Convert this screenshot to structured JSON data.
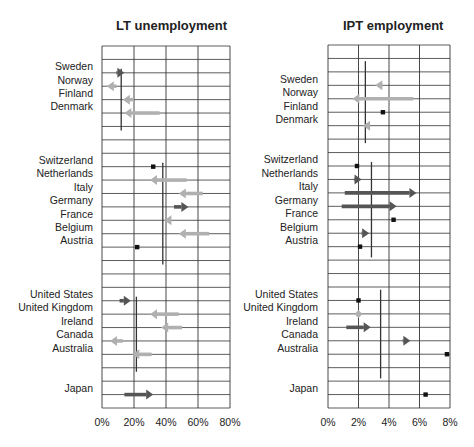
{
  "chart_data": [
    {
      "type": "arrow-dot",
      "title": "LT unemployment",
      "xlabel": "",
      "ylabel": "",
      "xlim": [
        0,
        80
      ],
      "x_ticks": [
        "0%",
        "20%",
        "40%",
        "60%",
        "80%"
      ],
      "grid": true,
      "rows_total": 27,
      "groups": [
        {
          "avg": 12,
          "rows": [
            2,
            6
          ]
        },
        {
          "avg": 38,
          "rows": [
            9,
            16
          ]
        },
        {
          "avg": 21.5,
          "rows": [
            19,
            24
          ]
        }
      ],
      "countries": [
        {
          "name": "Sweden",
          "row": 2,
          "from": 9,
          "to": 14,
          "style": "dark"
        },
        {
          "name": "Norway",
          "row": 3,
          "from": 9,
          "to": 3,
          "style": "light"
        },
        {
          "name": "Finland",
          "row": 4,
          "from": 20,
          "to": 13,
          "style": "light"
        },
        {
          "name": "Denmark",
          "row": 5,
          "from": 36,
          "to": 14,
          "style": "light"
        },
        {
          "name": "Switzerland",
          "row": 9,
          "from": 32,
          "to": 32,
          "style": "dot"
        },
        {
          "name": "Netherlands",
          "row": 10,
          "from": 53,
          "to": 30,
          "style": "light"
        },
        {
          "name": "Italy",
          "row": 11,
          "from": 63,
          "to": 48,
          "style": "light"
        },
        {
          "name": "Germany",
          "row": 12,
          "from": 45,
          "to": 54,
          "style": "dark"
        },
        {
          "name": "France",
          "row": 13,
          "from": 43,
          "to": 39,
          "style": "light"
        },
        {
          "name": "Belgium",
          "row": 14,
          "from": 67,
          "to": 48,
          "style": "light"
        },
        {
          "name": "Austria",
          "row": 15,
          "from": 22,
          "to": 22,
          "style": "dot"
        },
        {
          "name": "United States",
          "row": 19,
          "from": 11,
          "to": 18,
          "style": "dark"
        },
        {
          "name": "United Kingdom",
          "row": 20,
          "from": 48,
          "to": 30,
          "style": "light"
        },
        {
          "name": "Ireland",
          "row": 21,
          "from": 50,
          "to": 37,
          "style": "light"
        },
        {
          "name": "Canada",
          "row": 22,
          "from": 13,
          "to": 5,
          "style": "light"
        },
        {
          "name": "Australia",
          "row": 23,
          "from": 31,
          "to": 19,
          "style": "light"
        },
        {
          "name": "Japan",
          "row": 26,
          "from": 14,
          "to": 32,
          "style": "dark"
        }
      ]
    },
    {
      "type": "arrow-dot",
      "title": "IPT employment",
      "xlabel": "",
      "ylabel": "",
      "xlim": [
        0,
        8
      ],
      "x_ticks": [
        "0%",
        "2%",
        "4%",
        "6%",
        "8%"
      ],
      "grid": true,
      "rows_total": 27,
      "groups": [
        {
          "avg": 2.45,
          "rows": [
            1.5,
            7
          ]
        },
        {
          "avg": 2.85,
          "rows": [
            9,
            15.5
          ]
        },
        {
          "avg": 3.45,
          "rows": [
            18.5,
            24.5
          ]
        }
      ],
      "countries": [
        {
          "name": "Sweden",
          "row": 3,
          "from": 3.6,
          "to": 3.1,
          "style": "light"
        },
        {
          "name": "Norway",
          "row": 4,
          "from": 5.6,
          "to": 1.6,
          "style": "light"
        },
        {
          "name": "Finland",
          "row": 5,
          "from": 3.6,
          "to": 3.6,
          "style": "dot"
        },
        {
          "name": "Denmark",
          "row": 6,
          "from": 2.6,
          "to": 2.3,
          "style": "light"
        },
        {
          "name": "Switzerland",
          "row": 9,
          "from": 1.9,
          "to": 1.9,
          "style": "dot"
        },
        {
          "name": "Netherlands",
          "row": 10,
          "from": 1.7,
          "to": 2.2,
          "style": "dark"
        },
        {
          "name": "Italy",
          "row": 11,
          "from": 1.1,
          "to": 5.8,
          "style": "dark"
        },
        {
          "name": "Germany",
          "row": 12,
          "from": 0.9,
          "to": 4.5,
          "style": "dark"
        },
        {
          "name": "France",
          "row": 13,
          "from": 4.3,
          "to": 4.3,
          "style": "dot"
        },
        {
          "name": "Belgium",
          "row": 14,
          "from": 2.2,
          "to": 2.7,
          "style": "dark"
        },
        {
          "name": "Austria",
          "row": 15,
          "from": 2.1,
          "to": 2.1,
          "style": "dot"
        },
        {
          "name": "United States",
          "row": 19,
          "from": 2.0,
          "to": 2.0,
          "style": "dot"
        },
        {
          "name": "United Kingdom",
          "row": 20,
          "from": 2.0,
          "to": 2.0,
          "style": "lightdiamond"
        },
        {
          "name": "Ireland",
          "row": 21,
          "from": 1.2,
          "to": 2.8,
          "style": "dark"
        },
        {
          "name": "Canada",
          "row": 22,
          "from": 4.9,
          "to": 5.4,
          "style": "dark"
        },
        {
          "name": "Australia",
          "row": 23,
          "from": 7.8,
          "to": 7.8,
          "style": "dot"
        },
        {
          "name": "Japan",
          "row": 26,
          "from": 6.4,
          "to": 6.4,
          "style": "dot"
        }
      ]
    }
  ],
  "colors": {
    "dark": "#555555",
    "light": "#b0b0b0",
    "grid": "#333333",
    "dot": "#111111",
    "avg_line": "#333333"
  }
}
